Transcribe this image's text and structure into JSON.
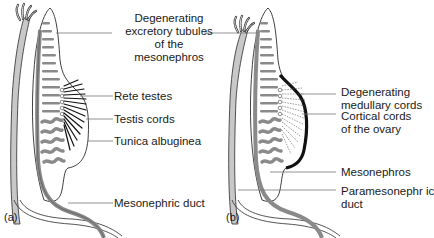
{
  "figure": {
    "panels": [
      {
        "id": "a",
        "tag": "(a)",
        "title": "Male gonad (testis) development",
        "labels": [
          {
            "key": "degenerating_tubules",
            "lines": [
              "Degenerating",
              "excretory tubules",
              "of the",
              "mesonephros"
            ]
          },
          {
            "key": "rete_testes",
            "text": "Rete testes"
          },
          {
            "key": "testis_cords",
            "text": "Testis cords"
          },
          {
            "key": "tunica_albuginea",
            "text": "Tunica albuginea"
          },
          {
            "key": "mesonephric_duct",
            "text": "Mesonephric duct"
          }
        ]
      },
      {
        "id": "b",
        "tag": "(b)",
        "title": "Female gonad (ovary) development",
        "labels": [
          {
            "key": "degenerating_medullary",
            "lines": [
              "Degenerating",
              "medullary cords"
            ]
          },
          {
            "key": "cortical_cords",
            "lines": [
              "Cortical cords",
              "of the ovary"
            ]
          },
          {
            "key": "mesonephros",
            "text": "Mesonephros"
          },
          {
            "key": "paramesonephric_duct",
            "lines": [
              "Paramesonephr ic",
              "duct"
            ]
          }
        ]
      }
    ],
    "colors": {
      "outline": "#2a2a2a",
      "duct_fill": "#c8c8c8",
      "tubule_fill": "#8a8a8a",
      "cord_dark": "#111111",
      "leader_line": "#777777",
      "background": "#ffffff"
    }
  }
}
